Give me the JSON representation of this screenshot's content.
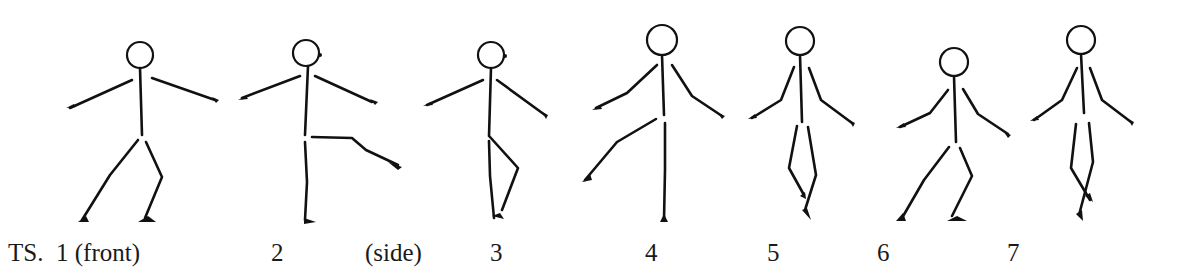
{
  "diagram": {
    "prefix_label": "TS.",
    "figures": [
      {
        "number": "1",
        "note": "(front)"
      },
      {
        "number": "2",
        "note": "(side)"
      },
      {
        "number": "3",
        "note": ""
      },
      {
        "number": "4",
        "note": ""
      },
      {
        "number": "5",
        "note": ""
      },
      {
        "number": "6",
        "note": ""
      },
      {
        "number": "7",
        "note": ""
      }
    ],
    "labels": {
      "prefix": "TS.",
      "fig1": "1 (front)",
      "fig2": "2",
      "fig2_note": "(side)",
      "fig3": "3",
      "fig4": "4",
      "fig5": "5",
      "fig6": "6",
      "fig7": "7"
    },
    "colors": {
      "ink": "#111111",
      "background": "#ffffff"
    }
  }
}
